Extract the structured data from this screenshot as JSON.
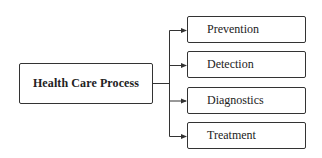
{
  "diagram": {
    "type": "tree",
    "orientation": "left-to-right",
    "root": {
      "label": "Health Care Process"
    },
    "children": [
      {
        "label": "Prevention"
      },
      {
        "label": "Detection"
      },
      {
        "label": "Diagnostics"
      },
      {
        "label": "Treatment"
      }
    ],
    "colors": {
      "stroke": "#333333",
      "background": "#ffffff",
      "text": "#222222"
    }
  }
}
